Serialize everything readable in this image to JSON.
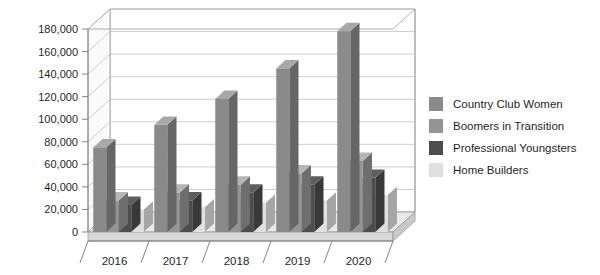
{
  "chart_data": {
    "type": "bar",
    "title": "",
    "subtitle": "",
    "xlabel": "",
    "ylabel": "",
    "categories": [
      "2016",
      "2017",
      "2018",
      "2019",
      "2020"
    ],
    "series": [
      {
        "name": "Country Club Women",
        "color": "#8a8a8a",
        "values": [
          75000,
          95000,
          118000,
          145000,
          178000
        ]
      },
      {
        "name": "Boomers in Transition",
        "color": "#949494",
        "values": [
          28000,
          35000,
          42000,
          52000,
          63000
        ]
      },
      {
        "name": "Professional Youngsters",
        "color": "#4d4d4d",
        "values": [
          24000,
          28000,
          35000,
          42000,
          48000
        ]
      },
      {
        "name": "Home Builders",
        "color": "#e0e0e0",
        "values": [
          20000,
          22000,
          26000,
          28000,
          33000
        ]
      }
    ],
    "ylim": [
      0,
      180000
    ],
    "ytick_values": [
      0,
      20000,
      40000,
      60000,
      80000,
      100000,
      120000,
      140000,
      160000,
      180000
    ],
    "ytick_labels": [
      "0",
      "20,000",
      "40,000",
      "60,000",
      "80,000",
      "100,000",
      "120,000",
      "140,000",
      "160,000",
      "180,000"
    ],
    "grid": true,
    "grid_axis": "y",
    "legend_position": "right",
    "three_d": true,
    "background_color": "#ffffff",
    "plot_background_color": "#ffffff",
    "gridline_color": "#b9b9b9",
    "axis_color": "#777777"
  }
}
